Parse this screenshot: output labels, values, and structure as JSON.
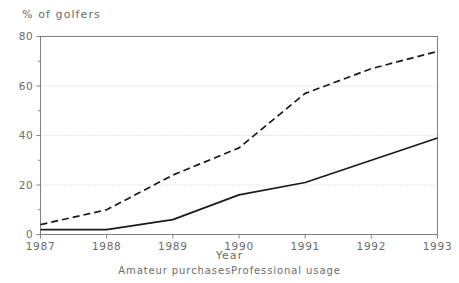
{
  "chart_data": {
    "type": "line",
    "title": "",
    "ylabel": "% of golfers",
    "xlabel": "Year",
    "x": [
      1987,
      1988,
      1989,
      1990,
      1991,
      1992,
      1993
    ],
    "xlim": [
      1987,
      1993
    ],
    "ylim": [
      0,
      80
    ],
    "yticks": [
      0,
      20,
      40,
      60,
      80
    ],
    "ytick_labels": [
      "0",
      "20",
      "40",
      "60",
      "80"
    ],
    "yminor_ticks": [
      10,
      30,
      50,
      70
    ],
    "xticks": [
      1987,
      1988,
      1989,
      1990,
      1991,
      1992,
      1993
    ],
    "xtick_labels": [
      "1987",
      "1988",
      "1989",
      "1990",
      "1991",
      "1992",
      "1993"
    ],
    "grid": "horizontal-dotted",
    "legend_position": "below",
    "series": [
      {
        "name": "Amateur purchases",
        "style": "solid",
        "color": "#1a1a1a",
        "values": [
          2,
          2,
          6,
          16,
          21,
          30,
          39
        ]
      },
      {
        "name": "Professional usage",
        "style": "dashed",
        "color": "#1a1a1a",
        "values": [
          4,
          10,
          24,
          35,
          57,
          67,
          74
        ]
      }
    ]
  },
  "axis": {
    "y_axis_label": "% of golfers",
    "x_axis_label": "Year"
  },
  "legend": {
    "entries": [
      {
        "label": "Amateur purchases"
      },
      {
        "label": "Professional usage"
      }
    ]
  },
  "colors": {
    "line": "#1a1a1a",
    "axis": "#808080",
    "grid": "#c8c8c8",
    "text": "#6b6b6b",
    "background": "#ffffff"
  }
}
